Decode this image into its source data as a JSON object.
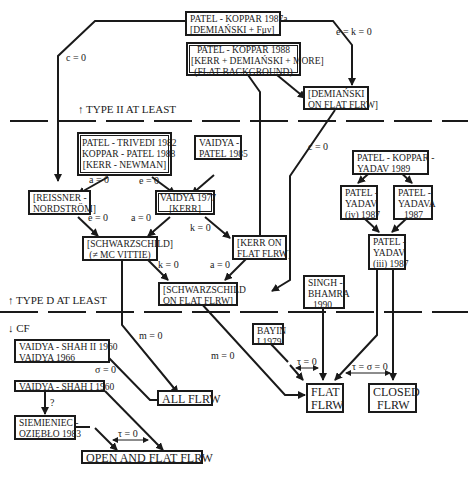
{
  "bands": {
    "type_ii": "↑ TYPE II AT LEAST",
    "type_d": "↑ TYPE D AT LEAST",
    "cf": "↓ CF"
  },
  "nodes": {
    "pk1987a": [
      "PATEL - KOPPAR 1987a",
      "[DEMIAŃSKI + Fμν]"
    ],
    "pk1988": [
      "PATEL - KOPPAR 1988",
      "[KERR + DEMIAŃSKI + MORE]",
      "(FLAT BACKGROUND)"
    ],
    "demianski_flat": [
      "[DEMIAŃSKI",
      "ON FLAT FLRW]"
    ],
    "pt1982": [
      "PATEL - TRIVEDI 1982",
      "KOPPAR - PATEL 1988",
      "[KERR - NEWMAN]"
    ],
    "vp1985": [
      "VAIDYA -",
      "PATEL 1985"
    ],
    "pky1989": [
      "PATEL - KOPPAR -",
      "YADAV 1989"
    ],
    "rn": [
      "[REISSNER -",
      "NORDSTRÖM]"
    ],
    "v1977": [
      "VAIDYA 1977",
      "[KERR]"
    ],
    "py_iv": [
      "PATEL -",
      "YADAV",
      "(iv) 1987"
    ],
    "pya1987": [
      "PATEL -",
      "YADAVA",
      "1987"
    ],
    "schw": [
      "[SCHWARZSCHILD]",
      "(≠ MC VITTIE)"
    ],
    "kerr_flat": [
      "[KERR ON",
      "FLAT FLRW]"
    ],
    "py_iii": [
      "PATEL -",
      "YADAV",
      "(iii) 1987"
    ],
    "schw_flat": [
      "[SCHWARZSCHILD",
      "ON FLAT FLRW]"
    ],
    "sb1990": [
      "SINGH -",
      "BHAMRA",
      "1990"
    ],
    "vs2": [
      "VAIDYA - SHAH II 1960",
      "VAIDYA 1966"
    ],
    "bayin": [
      "BAYIN",
      "I 1979"
    ],
    "vs1": [
      "VAIDYA - SHAH I 1960"
    ],
    "all_flrw": [
      "ALL FLRW"
    ],
    "flat_flrw": [
      "FLAT",
      "FLRW"
    ],
    "closed_flrw": [
      "CLOSED",
      "FLRW"
    ],
    "sz1983": [
      "SIEMIENIEC -",
      "OZIĘBŁO 1983"
    ],
    "open_flat": [
      "OPEN AND FLAT FLRW"
    ]
  },
  "edge_labels": {
    "c0_left": "c = 0",
    "ek0": "e = k = 0",
    "c0_right": "c = 0",
    "a0_rn": "a = 0",
    "e0_v": "e = 0",
    "e0_rn": "e = 0",
    "a0_v": "a = 0",
    "k0_v": "k = 0",
    "k0_schw": "k = 0",
    "a0_kerr": "a = 0",
    "m0_left": "m = 0",
    "m0_mid": "m = 0",
    "sigma0": "σ = 0",
    "question": "?",
    "tau0_open": "τ = 0",
    "tau0_flat": "τ = 0",
    "tau_sigma0": "τ = σ = 0"
  }
}
